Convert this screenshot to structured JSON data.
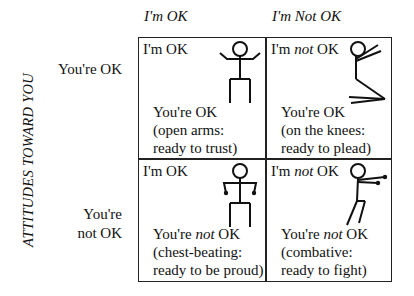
{
  "columns": {
    "left": "I'm OK",
    "right": "I'm Not OK"
  },
  "vertical_label": "ATTITUDES TOWARD YOU",
  "rows": {
    "top": "You're OK",
    "bottom_line1": "You're",
    "bottom_line2": "not OK"
  },
  "cells": [
    {
      "head_pre": "I'm OK",
      "head_em": "",
      "head_post": "",
      "desc_pre": "You're OK",
      "desc_em": "",
      "desc_post": "",
      "line2": "(open arms:",
      "line3": "ready to trust)",
      "figure": "open-arms-figure"
    },
    {
      "head_pre": "I'm ",
      "head_em": "not",
      "head_post": " OK",
      "desc_pre": "You're OK",
      "desc_em": "",
      "desc_post": "",
      "line2": "(on the knees:",
      "line3": "ready to plead)",
      "figure": "kneeling-figure"
    },
    {
      "head_pre": "I'm OK",
      "head_em": "",
      "head_post": "",
      "desc_pre": "You're ",
      "desc_em": "not",
      "desc_post": " OK",
      "line2": "(chest-beating:",
      "line3": "ready to be proud)",
      "figure": "chest-beating-figure"
    },
    {
      "head_pre": "I'm ",
      "head_em": "not",
      "head_post": " OK",
      "desc_pre": "You're ",
      "desc_em": "not",
      "desc_post": " OK",
      "line2": "(combative:",
      "line3": "ready to fight)",
      "figure": "combative-figure"
    }
  ]
}
